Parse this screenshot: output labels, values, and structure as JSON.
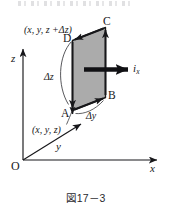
{
  "figure": {
    "caption": "図17－3",
    "background_color": "#ffffff",
    "ink_color": "#17171a",
    "face_fill_color": "#a8a8a8",
    "face_edge_color": "#1a1a1a"
  },
  "axes": {
    "origin_label": "O",
    "x_label": "x",
    "y_label": "y",
    "z_label": "z"
  },
  "vertices": {
    "a": "A",
    "b": "B",
    "c": "C",
    "d": "D"
  },
  "labels": {
    "corner_lower": "(x, y, z)",
    "corner_upper": "(x, y, z +Δz)",
    "delta_z": "Δz",
    "delta_y": "Δy",
    "current_symbol": "i",
    "current_subscript": "x"
  }
}
